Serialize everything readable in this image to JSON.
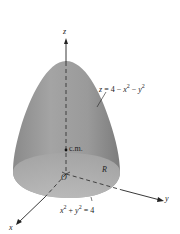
{
  "figure": {
    "surface_equation": {
      "lhs": "z",
      "eq": " = 4 − ",
      "x": "x",
      "minus": " − ",
      "y": "y",
      "exp": "2"
    },
    "axes": {
      "x": "x",
      "y": "y",
      "z": "z"
    },
    "origin_label": "O",
    "center_of_mass_label": "c.m.",
    "region_label": "R",
    "boundary_equation": {
      "x": "x",
      "plus": " + ",
      "y": "y",
      "rhs": " = 4",
      "exp": "2"
    },
    "colors": {
      "surface": "#8c8c8c",
      "surface_light": "#b4b4b4",
      "axis": "#222222"
    }
  }
}
